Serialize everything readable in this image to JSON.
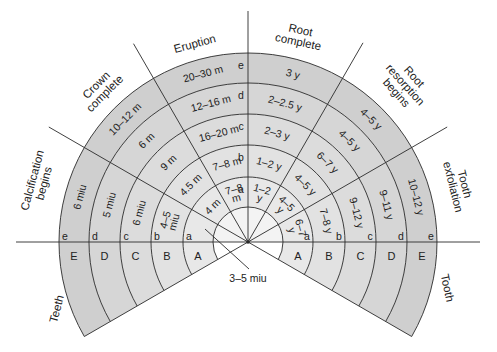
{
  "diagram": {
    "colors": {
      "ring_e": "#cfcfcf",
      "ring_d": "#d6d6d6",
      "ring_c": "#dcdcdc",
      "ring_b": "#e2e2e2",
      "ring_a": "#e8e8e8",
      "core": "#f3f3f3",
      "lines": "#2a2a2a",
      "text": "#222222"
    },
    "stages": [
      {
        "id": "calcification",
        "label_lines": [
          "Calcification",
          "begins"
        ],
        "values": {
          "e": "6 miu",
          "d": "5 miu",
          "c": "6 miu",
          "b": [
            "4–5",
            "miu"
          ],
          "a": ""
        }
      },
      {
        "id": "crown",
        "label_lines": [
          "Crown",
          "complete"
        ],
        "values": {
          "e": "10–12 m",
          "d": "6 m",
          "c": "9 m",
          "b": "4.5 m",
          "a": "4 m"
        }
      },
      {
        "id": "eruption",
        "label_lines": [
          "Eruption"
        ],
        "values": {
          "e": "20–30 m",
          "d": "12–16 m",
          "c": "16–20 m",
          "b": "7–8 m",
          "a": [
            "7–8",
            "m"
          ]
        }
      },
      {
        "id": "root",
        "label_lines": [
          "Root",
          "complete"
        ],
        "values": {
          "e": "3 y",
          "d": "2–2.5 y",
          "c": "2–3 y",
          "b": "1–2 y",
          "a": [
            "1–2",
            "y"
          ]
        }
      },
      {
        "id": "resorption",
        "label_lines": [
          "Root",
          "resorption",
          "begins"
        ],
        "values": {
          "e": "4–5 y",
          "d": "4–5 y",
          "c": "6–7 y",
          "b": "4–5 y",
          "a": [
            "4–5",
            "y"
          ]
        }
      },
      {
        "id": "exfoliation",
        "label_lines": [
          "Tooth",
          "exfoliation"
        ],
        "values": {
          "e": "10–12 y",
          "d": "9–11 y",
          "c": "9–12 y",
          "b": "7–8 y",
          "a": [
            "6–7",
            "y"
          ]
        }
      }
    ],
    "ring_letters": [
      "a",
      "b",
      "c",
      "d",
      "e"
    ],
    "teeth_letters": [
      "A",
      "B",
      "C",
      "D",
      "E"
    ],
    "teeth_label": "Teeth",
    "tooth_label": "Tooth",
    "pointer_label": "3–5 miu"
  }
}
